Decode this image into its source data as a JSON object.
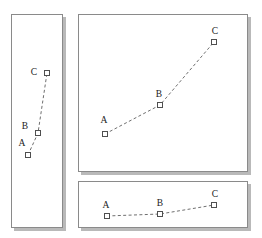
{
  "figure": {
    "background_color": "#ffffff",
    "panel_border_color": "#8a8a8a",
    "marker_edge_color": "#4f4f4f",
    "line_color": "#6f6f6f",
    "label_color": "#1a1a1a",
    "marker_shape": "open-square",
    "line_style": "dashed",
    "panel_count": 3
  },
  "chart_data": [
    {
      "type": "line",
      "name": "tall-narrow-panel",
      "title": "",
      "xlabel": "",
      "ylabel": "",
      "grid": false,
      "legend": "none",
      "panel_box": {
        "x": 11,
        "y": 14,
        "width": 52,
        "height": 214
      },
      "xlim": [
        0,
        1
      ],
      "ylim": [
        0,
        1
      ],
      "categories": [
        "A",
        "B",
        "C"
      ],
      "point_labels": [
        "A",
        "B",
        "C"
      ],
      "points": [
        {
          "label": "A",
          "x": 0.33,
          "y": 0.34,
          "px": 28,
          "py": 155,
          "label_px": 22,
          "label_py": 146
        },
        {
          "label": "B",
          "x": 0.52,
          "y": 0.44,
          "px": 38,
          "py": 133,
          "label_px": 25,
          "label_py": 129
        },
        {
          "label": "C",
          "x": 0.69,
          "y": 0.72,
          "px": 47,
          "py": 73,
          "label_px": 34,
          "label_py": 75
        }
      ]
    },
    {
      "type": "line",
      "name": "large-square-panel",
      "title": "",
      "xlabel": "",
      "ylabel": "",
      "grid": false,
      "legend": "none",
      "panel_box": {
        "x": 78,
        "y": 14,
        "width": 170,
        "height": 158
      },
      "xlim": [
        0,
        1
      ],
      "ylim": [
        0,
        1
      ],
      "categories": [
        "A",
        "B",
        "C"
      ],
      "point_labels": [
        "A",
        "B",
        "C"
      ],
      "points": [
        {
          "label": "A",
          "x": 0.16,
          "y": 0.24,
          "px": 105,
          "py": 134,
          "label_px": 104,
          "label_py": 123
        },
        {
          "label": "B",
          "x": 0.48,
          "y": 0.42,
          "px": 160,
          "py": 105,
          "label_px": 159,
          "label_py": 97
        },
        {
          "label": "C",
          "x": 0.8,
          "y": 0.82,
          "px": 214,
          "py": 42,
          "label_px": 215,
          "label_py": 34
        }
      ]
    },
    {
      "type": "line",
      "name": "wide-short-panel",
      "title": "",
      "xlabel": "",
      "ylabel": "",
      "grid": false,
      "legend": "none",
      "panel_box": {
        "x": 78,
        "y": 181,
        "width": 170,
        "height": 47
      },
      "xlim": [
        0,
        1
      ],
      "ylim": [
        0,
        1
      ],
      "categories": [
        "A",
        "B",
        "C"
      ],
      "point_labels": [
        "A",
        "B",
        "C"
      ],
      "points": [
        {
          "label": "A",
          "x": 0.17,
          "y": 0.24,
          "px": 107,
          "py": 216,
          "label_px": 106,
          "label_py": 208
        },
        {
          "label": "B",
          "x": 0.48,
          "y": 0.38,
          "px": 160,
          "py": 214,
          "label_px": 160,
          "label_py": 206
        },
        {
          "label": "C",
          "x": 0.8,
          "y": 0.6,
          "px": 214,
          "py": 205,
          "label_px": 215,
          "label_py": 197
        }
      ]
    }
  ]
}
